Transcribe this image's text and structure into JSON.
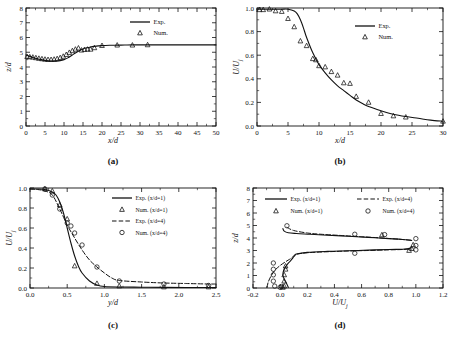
{
  "figure": {
    "background": "#ffffff",
    "line_color": "#111111",
    "marker_color": "#111111",
    "width": 453,
    "height": 357
  },
  "panels": [
    {
      "id": "a",
      "caption": "(a)",
      "xlabel": "x/d",
      "ylabel": "z/d",
      "xlim": [
        0,
        50
      ],
      "ylim": [
        0,
        8
      ],
      "xticks": [
        0,
        5,
        10,
        15,
        20,
        25,
        30,
        35,
        40,
        45,
        50
      ],
      "yticks": [
        0,
        1,
        2,
        3,
        4,
        5,
        6,
        7,
        8
      ],
      "xticklabels": [
        "0",
        "5",
        "10",
        "15",
        "20",
        "25",
        "30",
        "35",
        "40",
        "45",
        "50"
      ],
      "yticklabels": [
        "0",
        "1",
        "2",
        "3",
        "4",
        "5",
        "6",
        "7",
        "8"
      ],
      "legend": [
        {
          "label": "Exp.",
          "style": "solid-line"
        },
        {
          "label": "Num.",
          "style": "triangle-marker"
        }
      ]
    },
    {
      "id": "b",
      "caption": "(b)",
      "xlabel": "x/d",
      "ylabel": "U/U",
      "ylabel_sub": "j",
      "xlim": [
        0,
        30
      ],
      "ylim": [
        0.0,
        1.0
      ],
      "xticks": [
        0,
        5,
        10,
        15,
        20,
        25,
        30
      ],
      "yticks": [
        0.0,
        0.2,
        0.4,
        0.6,
        0.8,
        1.0
      ],
      "xticklabels": [
        "0",
        "5",
        "10",
        "15",
        "20",
        "25",
        "30"
      ],
      "yticklabels": [
        "0.0",
        "0.2",
        "0.4",
        "0.6",
        "0.8",
        "1.0"
      ],
      "legend": [
        {
          "label": "Exp.",
          "style": "solid-line"
        },
        {
          "label": "Num.",
          "style": "triangle-marker"
        }
      ]
    },
    {
      "id": "c",
      "caption": "(c)",
      "xlabel": "y/d",
      "ylabel": "U/U",
      "ylabel_sub": "j",
      "xlim": [
        0.0,
        2.5
      ],
      "ylim": [
        0.0,
        1.0
      ],
      "xticks": [
        0.0,
        0.5,
        1.0,
        1.5,
        2.0,
        2.5
      ],
      "yticks": [
        0.0,
        0.2,
        0.4,
        0.6,
        0.8,
        1.0
      ],
      "xticklabels": [
        "0.0",
        "0.5",
        "1.0",
        "1.5",
        "2.0",
        "2.5"
      ],
      "yticklabels": [
        "0.0",
        "0.2",
        "0.4",
        "0.6",
        "0.8",
        "1.0"
      ],
      "legend": [
        {
          "label": "Exp. (x/d=1)",
          "style": "solid-line"
        },
        {
          "label": "Num. (x/d=1)",
          "style": "triangle-marker"
        },
        {
          "label": "Exp. (x/d=4)",
          "style": "dashed-line"
        },
        {
          "label": "Num. (x/d=4)",
          "style": "circle-marker"
        }
      ]
    },
    {
      "id": "d",
      "caption": "(d)",
      "xlabel": "U/U",
      "xlabel_sub": "j",
      "ylabel": "z/d",
      "xlim": [
        -0.2,
        1.2
      ],
      "ylim": [
        0,
        8
      ],
      "xticks": [
        -0.2,
        0.0,
        0.2,
        0.4,
        0.6,
        0.8,
        1.0,
        1.2
      ],
      "yticks": [
        0,
        1,
        2,
        3,
        4,
        5,
        6,
        7,
        8
      ],
      "xticklabels": [
        "-0.2",
        "0.0",
        "0.2",
        "0.4",
        "0.6",
        "0.8",
        "1.0",
        "1.2"
      ],
      "yticklabels": [
        "0",
        "1",
        "2",
        "3",
        "4",
        "5",
        "6",
        "7",
        "8"
      ],
      "legend": [
        {
          "label": "Exp. (x/d=1)",
          "style": "solid-line"
        },
        {
          "label": "Num. (x/d=1)",
          "style": "triangle-marker"
        },
        {
          "label": "Exp. (x/d=4)",
          "style": "dashed-line"
        },
        {
          "label": "Num. (x/d=4)",
          "style": "circle-marker"
        }
      ]
    }
  ],
  "chart_data": [
    {
      "type": "line",
      "panel": "a",
      "title": "(a)",
      "xlabel": "x/d",
      "ylabel": "z/d",
      "xlim": [
        0,
        50
      ],
      "ylim": [
        0,
        8
      ],
      "grid": false,
      "legend_position": "top-right",
      "series": [
        {
          "name": "Exp.",
          "style": "solid-line",
          "x": [
            0,
            1,
            2,
            3,
            4,
            5,
            6,
            7,
            8,
            9,
            10,
            11,
            12,
            13,
            14,
            15,
            16,
            17,
            18,
            19,
            20,
            22,
            24,
            26,
            28,
            30,
            33,
            36,
            40,
            45,
            50
          ],
          "y": [
            4.82,
            4.72,
            4.63,
            4.56,
            4.5,
            4.45,
            4.42,
            4.4,
            4.4,
            4.43,
            4.5,
            4.62,
            4.78,
            4.95,
            5.1,
            5.22,
            5.3,
            5.36,
            5.4,
            5.43,
            5.45,
            5.47,
            5.48,
            5.49,
            5.5,
            5.5,
            5.5,
            5.5,
            5.5,
            5.5,
            5.5
          ]
        },
        {
          "name": "Num.",
          "style": "triangle-marker",
          "x": [
            0.3,
            1.0,
            1.8,
            2.6,
            3.4,
            4.2,
            5.0,
            5.8,
            6.6,
            7.4,
            8.2,
            9.0,
            9.8,
            10.6,
            11.4,
            12.2,
            13.0,
            13.8,
            14.6,
            15.4,
            16.2,
            17.0,
            18.0,
            20.0,
            24.0,
            28.0,
            32.0
          ],
          "y": [
            4.7,
            4.68,
            4.66,
            4.62,
            4.58,
            4.55,
            4.52,
            4.5,
            4.5,
            4.52,
            4.56,
            4.63,
            4.72,
            4.84,
            4.98,
            5.1,
            5.2,
            5.28,
            5.14,
            5.18,
            5.2,
            5.2,
            5.3,
            5.45,
            5.48,
            5.48,
            5.5
          ]
        }
      ]
    },
    {
      "type": "line",
      "panel": "b",
      "title": "(b)",
      "xlabel": "x/d",
      "ylabel": "U/Uj",
      "xlim": [
        0,
        30
      ],
      "ylim": [
        0.0,
        1.0
      ],
      "grid": false,
      "legend_position": "top-right",
      "series": [
        {
          "name": "Exp.",
          "style": "solid-line",
          "x": [
            0,
            1,
            2,
            3,
            4,
            5,
            6,
            6.5,
            7,
            7.5,
            8,
            9,
            10,
            11,
            12,
            13,
            14,
            15,
            16,
            17,
            18,
            20,
            22,
            24,
            26,
            28,
            30
          ],
          "y": [
            0.99,
            0.99,
            0.99,
            0.99,
            0.99,
            0.99,
            0.975,
            0.95,
            0.9,
            0.83,
            0.75,
            0.62,
            0.52,
            0.45,
            0.39,
            0.34,
            0.3,
            0.26,
            0.22,
            0.19,
            0.165,
            0.13,
            0.1,
            0.08,
            0.065,
            0.05,
            0.04
          ]
        },
        {
          "name": "Num.",
          "style": "triangle-marker",
          "x": [
            0.4,
            1.0,
            2.0,
            3.0,
            4.0,
            5.0,
            6.0,
            7.0,
            8.0,
            9.0,
            9.5,
            10.0,
            11.0,
            12.0,
            13.0,
            14.0,
            15.0,
            16.0,
            18.0,
            20.0,
            22.0,
            24.0,
            30.0
          ],
          "y": [
            0.985,
            0.985,
            0.99,
            0.975,
            0.97,
            0.91,
            0.84,
            0.72,
            0.68,
            0.57,
            0.56,
            0.51,
            0.5,
            0.46,
            0.43,
            0.365,
            0.36,
            0.25,
            0.2,
            0.105,
            0.085,
            0.075,
            0.04
          ]
        }
      ]
    },
    {
      "type": "line",
      "panel": "c",
      "title": "(c)",
      "xlabel": "y/d",
      "ylabel": "U/Uj",
      "xlim": [
        0.0,
        2.5
      ],
      "ylim": [
        0.0,
        1.0
      ],
      "grid": false,
      "legend_position": "top-right",
      "series": [
        {
          "name": "Exp. (x/d=1)",
          "style": "solid-line",
          "x": [
            0.0,
            0.1,
            0.2,
            0.3,
            0.35,
            0.4,
            0.45,
            0.5,
            0.55,
            0.6,
            0.65,
            0.7,
            0.8,
            0.9,
            1.0,
            1.2,
            1.5,
            1.8,
            2.1,
            2.4,
            2.5
          ],
          "y": [
            0.99,
            0.99,
            0.985,
            0.96,
            0.93,
            0.86,
            0.75,
            0.6,
            0.45,
            0.32,
            0.22,
            0.15,
            0.07,
            0.03,
            0.015,
            0.01,
            0.008,
            0.006,
            0.005,
            0.005,
            0.005
          ]
        },
        {
          "name": "Num. (x/d=1)",
          "style": "triangle-marker",
          "x": [
            0.2,
            0.3,
            0.4,
            0.5,
            0.6,
            0.9,
            1.2,
            1.8,
            2.4
          ],
          "y": [
            0.99,
            0.97,
            0.83,
            0.69,
            0.22,
            0.045,
            0.02,
            0.01,
            0.01
          ]
        },
        {
          "name": "Exp. (x/d=4)",
          "style": "dashed-line",
          "x": [
            0.0,
            0.1,
            0.2,
            0.3,
            0.4,
            0.5,
            0.6,
            0.7,
            0.8,
            0.9,
            1.0,
            1.1,
            1.2,
            1.5,
            1.8,
            2.1,
            2.4,
            2.5
          ],
          "y": [
            0.99,
            0.985,
            0.97,
            0.93,
            0.79,
            0.63,
            0.5,
            0.38,
            0.28,
            0.21,
            0.15,
            0.1,
            0.075,
            0.06,
            0.05,
            0.045,
            0.04,
            0.04
          ]
        },
        {
          "name": "Num. (x/d=4)",
          "style": "circle-marker",
          "x": [
            0.2,
            0.3,
            0.4,
            0.5,
            0.55,
            0.6,
            0.7,
            0.9,
            1.2,
            1.8,
            2.4
          ],
          "y": [
            0.99,
            0.93,
            0.79,
            0.65,
            0.62,
            0.55,
            0.43,
            0.21,
            0.07,
            0.04,
            0.025
          ]
        }
      ]
    },
    {
      "type": "line",
      "panel": "d",
      "title": "(d)",
      "xlabel": "U/Uj",
      "ylabel": "z/d",
      "xlim": [
        -0.2,
        1.2
      ],
      "ylim": [
        0,
        8
      ],
      "grid": false,
      "legend_position": "top",
      "series": [
        {
          "name": "Exp. (x/d=1)",
          "style": "solid-line",
          "x": [
            0.06,
            0.05,
            0.03,
            0.02,
            0.03,
            0.05,
            0.07,
            0.09,
            0.1,
            0.11,
            0.12,
            0.2,
            0.35,
            0.5,
            0.65,
            0.8,
            0.9,
            0.95,
            0.97
          ],
          "y": [
            0.05,
            0.3,
            0.7,
            1.1,
            1.5,
            1.85,
            2.1,
            2.35,
            2.5,
            2.62,
            2.72,
            2.85,
            2.93,
            2.98,
            3.03,
            3.08,
            3.1,
            3.15,
            3.3
          ]
        },
        {
          "name": "Exp. (x/d=1) upper",
          "style": "solid-line",
          "x": [
            0.02,
            0.03,
            0.06,
            0.12,
            0.22,
            0.35,
            0.5,
            0.65,
            0.8,
            0.9,
            0.97
          ],
          "y": [
            4.75,
            4.55,
            4.42,
            4.36,
            4.3,
            4.22,
            4.14,
            4.05,
            3.95,
            3.88,
            3.8
          ]
        },
        {
          "name": "Exp. (x/d=4)",
          "style": "dashed-line",
          "x": [
            -0.095,
            -0.09,
            -0.07,
            -0.04,
            0.0,
            0.04,
            0.07,
            0.09,
            0.1,
            0.12,
            0.2,
            0.35,
            0.5,
            0.65,
            0.8,
            0.9,
            0.97
          ],
          "y": [
            0.05,
            0.4,
            0.9,
            1.4,
            1.8,
            2.1,
            2.3,
            2.45,
            2.58,
            2.7,
            2.82,
            2.9,
            2.96,
            3.0,
            3.05,
            3.08,
            3.12
          ]
        },
        {
          "name": "Exp. (x/d=4) upper",
          "style": "dashed-line",
          "x": [
            0.05,
            0.1,
            0.2,
            0.3,
            0.45,
            0.6,
            0.75,
            0.88,
            0.97
          ],
          "y": [
            4.85,
            4.6,
            4.4,
            4.3,
            4.2,
            4.1,
            4.0,
            3.9,
            3.82
          ]
        },
        {
          "name": "Num. (x/d=1)",
          "style": "triangle-marker",
          "x": [
            0.02,
            0.03,
            0.03,
            0.03,
            0.04,
            0.04,
            0.75,
            0.95,
            0.97,
            0.98
          ],
          "y": [
            0.05,
            0.15,
            0.55,
            1.05,
            1.5,
            1.75,
            4.25,
            3.0,
            3.15,
            3.45
          ]
        },
        {
          "name": "Num. (x/d=4)",
          "style": "circle-marker",
          "x": [
            -0.05,
            -0.05,
            -0.05,
            -0.05,
            -0.04,
            0.0,
            0.01,
            0.05,
            0.55,
            0.55,
            0.77,
            1.0,
            1.0,
            1.0
          ],
          "y": [
            0.55,
            1.05,
            1.5,
            2.0,
            0.15,
            0.05,
            0.12,
            4.98,
            2.78,
            4.3,
            4.27,
            3.05,
            3.4,
            3.95
          ]
        }
      ]
    }
  ]
}
